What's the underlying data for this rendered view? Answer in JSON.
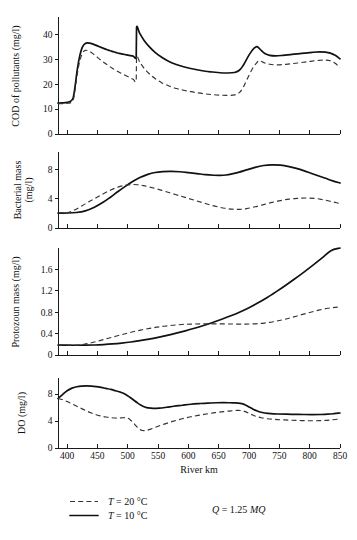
{
  "chart_data": {
    "type": "line",
    "title": "",
    "xlabel": "River km",
    "xlim": [
      385,
      850
    ],
    "xticks": [
      400,
      450,
      500,
      550,
      600,
      650,
      700,
      750,
      800,
      850
    ],
    "legend": {
      "position": "bottom-left",
      "entries": [
        {
          "name": "T = 20 °C",
          "style": "dashed",
          "label_prefix": "T",
          "label_rest": " = 20 °C"
        },
        {
          "name": "T = 10 °C",
          "style": "solid",
          "label_prefix": "T",
          "label_rest": " = 10 °C"
        }
      ],
      "annotation": {
        "symbol": "Q",
        "text": " = 1.25 ",
        "unit": "MQ",
        "full": "Q = 1.25 MQ"
      }
    },
    "panels": [
      {
        "id": "cod",
        "ylabel": "COD of pollutants (mg/l)",
        "ylim": [
          0,
          47
        ],
        "yticks": [
          0,
          10,
          20,
          30,
          40
        ],
        "series": [
          {
            "name": "T = 10 °C",
            "style": "solid",
            "x": [
              385,
              392,
              400,
              406,
              410,
              413,
              416,
              420,
              425,
              430,
              437,
              444,
              450,
              456,
              462,
              468,
              474,
              480,
              486,
              492,
              498,
              504,
              509,
              514,
              514.5,
              520,
              527,
              535,
              545,
              556,
              568,
              580,
              592,
              604,
              616,
              628,
              640,
              652,
              664,
              676,
              684,
              690,
              696,
              702,
              708,
              713,
              716,
              720,
              726,
              734,
              744,
              756,
              768,
              780,
              792,
              804,
              816,
              826,
              834,
              842,
              850
            ],
            "y": [
              12.4,
              12.5,
              12.7,
              13.2,
              14.6,
              18.8,
              24.5,
              30.4,
              34.8,
              36.4,
              36.5,
              36.0,
              35.4,
              34.8,
              34.2,
              33.7,
              33.2,
              32.8,
              32.4,
              32.1,
              31.8,
              31.5,
              31.3,
              31.2,
              42.8,
              40.3,
              37.6,
              35.2,
              32.8,
              30.8,
              29.1,
              27.9,
              27.0,
              26.3,
              25.7,
              25.2,
              24.9,
              24.6,
              24.5,
              24.7,
              25.6,
              27.4,
              30.0,
              32.5,
              34.4,
              35.1,
              34.6,
              33.6,
              32.3,
              31.6,
              31.4,
              31.6,
              31.9,
              32.2,
              32.5,
              32.8,
              33.0,
              32.9,
              32.5,
              31.6,
              30.2
            ]
          },
          {
            "name": "T = 20 °C",
            "style": "dashed",
            "x": [
              385,
              392,
              400,
              406,
              410,
              413,
              416,
              420,
              425,
              430,
              437,
              444,
              450,
              456,
              462,
              468,
              474,
              480,
              486,
              492,
              498,
              504,
              509,
              514,
              514.5,
              520,
              527,
              535,
              545,
              556,
              568,
              580,
              592,
              604,
              616,
              628,
              640,
              652,
              664,
              676,
              684,
              690,
              696,
              702,
              708,
              713,
              716,
              720,
              726,
              734,
              744,
              756,
              768,
              780,
              792,
              804,
              816,
              826,
              834,
              842,
              850
            ],
            "y": [
              12.2,
              12.2,
              12.3,
              12.6,
              13.6,
              17.4,
              22.8,
              28.4,
              32.3,
              33.6,
              33.2,
              32.0,
              30.8,
              29.6,
              28.5,
              27.5,
              26.5,
              25.6,
              24.8,
              24.0,
              23.3,
              22.6,
              22.0,
              21.5,
              31.0,
              28.8,
              26.4,
              24.3,
              22.3,
              20.6,
              19.3,
              18.3,
              17.6,
              17.0,
              16.5,
              16.1,
              15.8,
              15.6,
              15.5,
              15.7,
              16.6,
              18.6,
              21.6,
              24.6,
              27.2,
              28.7,
              29.4,
              29.2,
              28.5,
              28.0,
              27.8,
              27.9,
              28.2,
              28.5,
              28.9,
              29.3,
              29.6,
              29.7,
              29.4,
              28.4,
              26.6
            ]
          }
        ]
      },
      {
        "id": "bacterial",
        "ylabel": "Bacterial mass (mg/l)",
        "ylabel_line1": "Bacterial mass",
        "ylabel_line2": "(mg/l)",
        "ylim": [
          0,
          10.4
        ],
        "yticks": [
          0,
          4,
          8
        ],
        "series": [
          {
            "name": "T = 10 °C",
            "style": "solid",
            "x": [
              385,
              400,
              415,
              430,
              445,
              460,
              472,
              484,
              496,
              508,
              520,
              532,
              545,
              558,
              572,
              586,
              600,
              614,
              628,
              642,
              652,
              662,
              672,
              684,
              696,
              710,
              724,
              738,
              752,
              766,
              778,
              790,
              802,
              814,
              826,
              838,
              850
            ],
            "y": [
              2.05,
              2.05,
              2.12,
              2.35,
              2.85,
              3.55,
              4.25,
              5.0,
              5.7,
              6.35,
              6.9,
              7.3,
              7.6,
              7.72,
              7.75,
              7.7,
              7.58,
              7.45,
              7.3,
              7.22,
              7.2,
              7.25,
              7.4,
              7.65,
              7.95,
              8.3,
              8.55,
              8.65,
              8.6,
              8.4,
              8.15,
              7.85,
              7.5,
              7.15,
              6.8,
              6.45,
              6.15
            ]
          },
          {
            "name": "T = 20 °C",
            "style": "dashed",
            "x": [
              385,
              400,
              412,
              424,
              436,
              448,
              460,
              472,
              484,
              496,
              506,
              516,
              526,
              536,
              548,
              560,
              574,
              588,
              600,
              612,
              624,
              636,
              648,
              660,
              672,
              684,
              696,
              710,
              724,
              738,
              752,
              766,
              780,
              794,
              808,
              820,
              832,
              842,
              850
            ],
            "y": [
              2.05,
              2.1,
              2.45,
              3.0,
              3.6,
              4.15,
              4.7,
              5.2,
              5.6,
              5.85,
              5.95,
              5.92,
              5.8,
              5.6,
              5.35,
              5.05,
              4.7,
              4.35,
              4.05,
              3.75,
              3.45,
              3.15,
              2.9,
              2.7,
              2.58,
              2.55,
              2.65,
              2.9,
              3.2,
              3.5,
              3.75,
              3.95,
              4.05,
              4.1,
              4.05,
              3.9,
              3.7,
              3.5,
              3.35
            ]
          }
        ]
      },
      {
        "id": "protozoan",
        "ylabel": "Protozoun mass (mg/l)",
        "ylim": [
          0,
          2.0
        ],
        "yticks": [
          0,
          0.4,
          0.8,
          1.2,
          1.6
        ],
        "series": [
          {
            "name": "T = 10 °C",
            "style": "solid",
            "x": [
              385,
              400,
              415,
              430,
              445,
              460,
              475,
              490,
              505,
              520,
              535,
              550,
              565,
              580,
              595,
              610,
              625,
              640,
              655,
              670,
              685,
              700,
              715,
              730,
              745,
              760,
              775,
              790,
              805,
              820,
              835,
              850
            ],
            "y": [
              0.185,
              0.183,
              0.182,
              0.183,
              0.187,
              0.195,
              0.207,
              0.223,
              0.243,
              0.268,
              0.297,
              0.33,
              0.367,
              0.408,
              0.452,
              0.5,
              0.552,
              0.608,
              0.668,
              0.733,
              0.805,
              0.885,
              0.975,
              1.075,
              1.185,
              1.3,
              1.42,
              1.545,
              1.675,
              1.81,
              1.95,
              2.0
            ]
          },
          {
            "name": "T = 20 °C",
            "style": "dashed",
            "x": [
              385,
              400,
              415,
              428,
              440,
              452,
              464,
              476,
              488,
              500,
              512,
              524,
              536,
              548,
              560,
              575,
              590,
              605,
              620,
              635,
              650,
              665,
              680,
              695,
              710,
              725,
              740,
              755,
              770,
              785,
              800,
              815,
              830,
              842,
              850
            ],
            "y": [
              0.185,
              0.183,
              0.185,
              0.2,
              0.228,
              0.262,
              0.3,
              0.338,
              0.375,
              0.41,
              0.443,
              0.472,
              0.498,
              0.52,
              0.538,
              0.557,
              0.57,
              0.578,
              0.582,
              0.583,
              0.582,
              0.58,
              0.578,
              0.578,
              0.583,
              0.597,
              0.622,
              0.657,
              0.7,
              0.748,
              0.795,
              0.838,
              0.873,
              0.89,
              0.898
            ]
          }
        ]
      },
      {
        "id": "do",
        "ylabel": "DO (mg/l)",
        "ylim": [
          0,
          10.4
        ],
        "yticks": [
          0,
          4,
          8
        ],
        "series": [
          {
            "name": "T = 10 °C",
            "style": "solid",
            "x": [
              385,
              392,
              400,
              408,
              416,
              424,
              432,
              440,
              448,
              456,
              464,
              472,
              480,
              488,
              496,
              504,
              510,
              516,
              522,
              528,
              534,
              542,
              552,
              564,
              576,
              590,
              604,
              618,
              632,
              646,
              658,
              668,
              676,
              682,
              688,
              694,
              700,
              706,
              712,
              718,
              726,
              736,
              748,
              762,
              776,
              790,
              804,
              818,
              830,
              840,
              850
            ],
            "y": [
              7.35,
              7.9,
              8.5,
              8.9,
              9.1,
              9.2,
              9.23,
              9.2,
              9.12,
              9.0,
              8.85,
              8.7,
              8.5,
              8.3,
              8.0,
              7.5,
              7.1,
              6.7,
              6.35,
              6.1,
              5.95,
              5.88,
              5.92,
              6.05,
              6.2,
              6.35,
              6.5,
              6.6,
              6.68,
              6.72,
              6.73,
              6.72,
              6.7,
              6.68,
              6.6,
              6.4,
              6.1,
              5.8,
              5.55,
              5.35,
              5.2,
              5.1,
              5.05,
              5.02,
              5.0,
              4.98,
              4.97,
              4.98,
              5.02,
              5.1,
              5.2
            ]
          },
          {
            "name": "T = 20 °C",
            "style": "dashed",
            "x": [
              385,
              392,
              400,
              408,
              416,
              424,
              432,
              440,
              448,
              456,
              464,
              472,
              480,
              486,
              492,
              496,
              500,
              504,
              508,
              512,
              516,
              520,
              524,
              530,
              538,
              548,
              560,
              574,
              588,
              602,
              616,
              630,
              644,
              658,
              670,
              680,
              688,
              694,
              700,
              706,
              712,
              720,
              730,
              742,
              756,
              770,
              784,
              798,
              812,
              826,
              838,
              850
            ],
            "y": [
              7.35,
              7.2,
              6.9,
              6.55,
              6.2,
              5.85,
              5.5,
              5.2,
              4.95,
              4.75,
              4.6,
              4.5,
              4.45,
              4.45,
              4.5,
              4.5,
              4.42,
              4.2,
              3.85,
              3.45,
              3.05,
              2.75,
              2.6,
              2.6,
              2.8,
              3.15,
              3.55,
              3.95,
              4.3,
              4.6,
              4.85,
              5.05,
              5.25,
              5.4,
              5.52,
              5.58,
              5.55,
              5.4,
              5.15,
              4.9,
              4.7,
              4.5,
              4.35,
              4.25,
              4.18,
              4.12,
              4.08,
              4.05,
              4.05,
              4.1,
              4.2,
              4.3
            ]
          }
        ]
      }
    ]
  },
  "labels": {
    "panel1_ylabel": "COD of pollutants (mg/l)",
    "panel2_ylabel_line1": "Bacterial mass",
    "panel2_ylabel_line2": "(mg/l)",
    "panel3_ylabel": "Protozoun mass (mg/l)",
    "panel4_ylabel": "DO (mg/l)",
    "xaxis_title": "River km",
    "legend_dashed": " = 20 °C",
    "legend_solid": " = 10 °C",
    "legend_t_symbol": "T",
    "legend_q_symbol": "Q",
    "legend_q_value": " = 1.25 ",
    "legend_q_unit": "MQ",
    "p1_y0": "0",
    "p1_y1": "10",
    "p1_y2": "20",
    "p1_y3": "30",
    "p1_y4": "40",
    "p2_y0": "0",
    "p2_y1": "4",
    "p2_y2": "8",
    "p3_y0": "0",
    "p3_y1": "0.4",
    "p3_y2": "0.8",
    "p3_y3": "1.2",
    "p3_y4": "1.6",
    "p4_y0": "0",
    "p4_y1": "4",
    "p4_y2": "8",
    "x0": "400",
    "x1": "450",
    "x2": "500",
    "x3": "550",
    "x4": "600",
    "x5": "650",
    "x6": "700",
    "x7": "750",
    "x8": "800",
    "x9": "850"
  }
}
